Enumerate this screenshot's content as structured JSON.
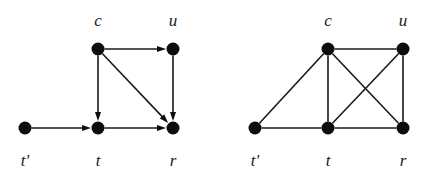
{
  "figure": {
    "width": 437,
    "height": 178,
    "background": "#ffffff",
    "ink_color": "#0d0d0d",
    "node_radius": 6.5,
    "graphs": [
      {
        "id": "left-graph",
        "name": "directed-graph",
        "type": "directed",
        "nodes": [
          {
            "id": "c",
            "label": "c",
            "x": 98,
            "y": 49,
            "label_x": 98,
            "label_y": 26
          },
          {
            "id": "u",
            "label": "u",
            "x": 173,
            "y": 49,
            "label_x": 173,
            "label_y": 26
          },
          {
            "id": "tp",
            "label": "t'",
            "x": 25,
            "y": 128,
            "label_x": 25,
            "label_y": 166
          },
          {
            "id": "t",
            "label": "t",
            "x": 98,
            "y": 128,
            "label_x": 98,
            "label_y": 166
          },
          {
            "id": "r",
            "label": "r",
            "x": 173,
            "y": 128,
            "label_x": 173,
            "label_y": 166
          }
        ],
        "edges": [
          {
            "from": "c",
            "to": "u",
            "directed": true
          },
          {
            "from": "c",
            "to": "t",
            "directed": true
          },
          {
            "from": "c",
            "to": "r",
            "directed": true
          },
          {
            "from": "u",
            "to": "r",
            "directed": true
          },
          {
            "from": "tp",
            "to": "t",
            "directed": true
          },
          {
            "from": "t",
            "to": "r",
            "directed": true
          }
        ]
      },
      {
        "id": "right-graph",
        "name": "undirected-graph",
        "type": "undirected",
        "nodes": [
          {
            "id": "c",
            "label": "c",
            "x": 328,
            "y": 49,
            "label_x": 328,
            "label_y": 26
          },
          {
            "id": "u",
            "label": "u",
            "x": 403,
            "y": 49,
            "label_x": 403,
            "label_y": 26
          },
          {
            "id": "tp",
            "label": "t'",
            "x": 255,
            "y": 128,
            "label_x": 255,
            "label_y": 166
          },
          {
            "id": "t",
            "label": "t",
            "x": 328,
            "y": 128,
            "label_x": 328,
            "label_y": 166
          },
          {
            "id": "r",
            "label": "r",
            "x": 403,
            "y": 128,
            "label_x": 403,
            "label_y": 166
          }
        ],
        "edges": [
          {
            "from": "c",
            "to": "u",
            "directed": false
          },
          {
            "from": "c",
            "to": "tp",
            "directed": false
          },
          {
            "from": "c",
            "to": "t",
            "directed": false
          },
          {
            "from": "c",
            "to": "r",
            "directed": false
          },
          {
            "from": "u",
            "to": "t",
            "directed": false
          },
          {
            "from": "u",
            "to": "r",
            "directed": false
          },
          {
            "from": "tp",
            "to": "t",
            "directed": false
          },
          {
            "from": "t",
            "to": "r",
            "directed": false
          }
        ]
      }
    ]
  }
}
